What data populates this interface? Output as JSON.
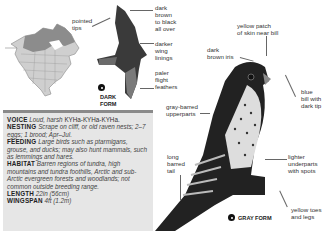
{
  "map": {
    "name": "range-map"
  },
  "dark_form": {
    "tag_line1": "DARK",
    "tag_line2": "FORM",
    "labels": {
      "pointed_tips": "pointed\ntips",
      "dark_brown": "dark\nbrown\nto black\nall over",
      "darker_linings": "darker\nwing\nlinings",
      "paler_flight": "paler\nflight\nfeathers"
    }
  },
  "gray_form": {
    "tag": "GRAY FORM",
    "labels": {
      "yellow_patch": "yellow patch\nof skin near bill",
      "dark_iris": "dark\nbrown iris",
      "blue_bill": "blue\nbill with\ndark tip",
      "gray_barred": "gray-barred\nupperparts",
      "long_tail": "long\nbarred\ntail",
      "lighter_underparts": "lighter\nunderparts\nwith spots",
      "yellow_toes": "yellow toes\nand legs"
    }
  },
  "facts": {
    "voice": {
      "label": "VOICE",
      "text_a": "Loud, harsh ",
      "call": "KYHa-KYHa-KYHa."
    },
    "nesting": {
      "label": "NESTING",
      "text": "Scrape on cliff, or old raven nests; 2–7 eggs; 1 brood; Apr–Jul."
    },
    "feeding": {
      "label": "FEEDING",
      "text": "Large birds such as ptarmigans, grouse, and ducks; may also hunt mammals, such as lemmings and hares."
    },
    "habitat": {
      "label": "HABITAT",
      "text": "Barren regions of tundra, high mountains and tundra foothills, Arctic and sub-Arctic evergreen forests and woodlands; not common outside breeding range."
    },
    "length": {
      "label": "LENGTH",
      "text": "22in (56cm)"
    },
    "wingspan": {
      "label": "WINGSPAN",
      "text": "4ft (1.2m)"
    }
  }
}
